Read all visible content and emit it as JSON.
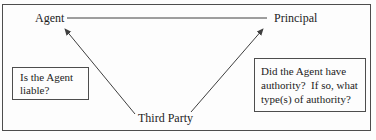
{
  "diagram": {
    "nodes": {
      "agent": "Agent",
      "principal": "Principal",
      "third_party": "Third Party"
    },
    "left_box": {
      "lines": [
        "Is the Agent",
        "liable?"
      ]
    },
    "right_box": {
      "lines": [
        "Did the Agent have",
        "authority?  If so, what",
        "type(s) of authority?"
      ]
    },
    "relationships": {
      "agent_principal": "plain line",
      "third_party_agent": "arrow toward Agent",
      "third_party_principal": "arrow toward Principal"
    },
    "colors": {
      "background": "#fdfdfd",
      "text": "#1c1c1c",
      "line": "#3f3f3f",
      "border": "#4d4d4d"
    }
  }
}
